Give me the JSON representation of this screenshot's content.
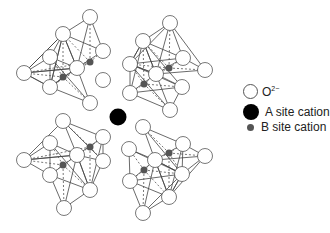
{
  "legend": {
    "items": [
      {
        "key": "oxygen",
        "label_base": "O",
        "label_sup": "2−",
        "symbol": "open-circle"
      },
      {
        "key": "a_site",
        "label": "A site cation",
        "symbol": "large-black-circle"
      },
      {
        "key": "b_site",
        "label": "B site cation",
        "symbol": "small-gray-circle"
      }
    ]
  },
  "colors": {
    "oxygen_fill": "#ffffff",
    "oxygen_stroke": "#555555",
    "a_site": "#000000",
    "b_site": "#555555",
    "bond": "#444444"
  },
  "structure": {
    "octahedra": [
      {
        "b": [
          90,
          62
        ],
        "o": [
          [
            90,
            17
          ],
          [
            24,
            73
          ],
          [
            77,
            68
          ],
          [
            103,
            51
          ],
          [
            50,
            87
          ],
          [
            63,
            34
          ]
        ]
      },
      {
        "b": [
          63,
          77
        ],
        "o": [
          [
            63,
            34
          ],
          [
            50,
            57
          ],
          [
            24,
            73
          ],
          [
            77,
            68
          ],
          [
            50,
            87
          ],
          [
            90,
            103
          ]
        ]
      },
      {
        "b": [
          169,
          68
        ],
        "o": [
          [
            170,
            23
          ],
          [
            143,
            41
          ],
          [
            156,
            74
          ],
          [
            183,
            58
          ],
          [
            205,
            70
          ],
          [
            130,
            64
          ]
        ]
      },
      {
        "b": [
          144,
          84
        ],
        "o": [
          [
            143,
            41
          ],
          [
            130,
            64
          ],
          [
            156,
            74
          ],
          [
            182,
            87
          ],
          [
            130,
            93
          ],
          [
            170,
            110
          ]
        ]
      },
      {
        "b": [
          90,
          147
        ],
        "o": [
          [
            63,
            121
          ],
          [
            103,
            137
          ],
          [
            77,
            155
          ],
          [
            103,
            161
          ],
          [
            24,
            160
          ],
          [
            90,
            190
          ]
        ]
      },
      {
        "b": [
          63,
          165
        ],
        "o": [
          [
            50,
            143
          ],
          [
            24,
            160
          ],
          [
            77,
            155
          ],
          [
            50,
            175
          ],
          [
            64,
            208
          ],
          [
            90,
            190
          ]
        ]
      },
      {
        "b": [
          169,
          153
        ],
        "o": [
          [
            143,
            127
          ],
          [
            183,
            144
          ],
          [
            155,
            160
          ],
          [
            205,
            156
          ],
          [
            182,
            174
          ],
          [
            169,
            197
          ]
        ]
      },
      {
        "b": [
          144,
          170
        ],
        "o": [
          [
            129,
            149
          ],
          [
            155,
            160
          ],
          [
            130,
            181
          ],
          [
            182,
            174
          ],
          [
            143,
            213
          ],
          [
            169,
            197
          ]
        ]
      }
    ],
    "oxygens": [
      [
        90,
        17
      ],
      [
        63,
        34
      ],
      [
        50,
        57
      ],
      [
        24,
        73
      ],
      [
        77,
        68
      ],
      [
        103,
        51
      ],
      [
        50,
        87
      ],
      [
        103,
        80
      ],
      [
        90,
        103
      ],
      [
        170,
        23
      ],
      [
        143,
        41
      ],
      [
        130,
        64
      ],
      [
        156,
        74
      ],
      [
        183,
        58
      ],
      [
        205,
        70
      ],
      [
        182,
        87
      ],
      [
        130,
        93
      ],
      [
        170,
        110
      ],
      [
        63,
        121
      ],
      [
        50,
        143
      ],
      [
        24,
        160
      ],
      [
        77,
        155
      ],
      [
        103,
        137
      ],
      [
        50,
        175
      ],
      [
        103,
        161
      ],
      [
        90,
        190
      ],
      [
        64,
        208
      ],
      [
        143,
        127
      ],
      [
        129,
        149
      ],
      [
        155,
        160
      ],
      [
        183,
        144
      ],
      [
        205,
        156
      ],
      [
        182,
        174
      ],
      [
        130,
        181
      ],
      [
        169,
        197
      ],
      [
        143,
        213
      ]
    ],
    "a_site": [
      118,
      117
    ]
  }
}
